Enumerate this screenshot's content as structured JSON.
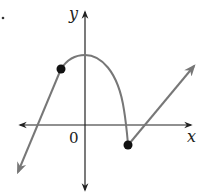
{
  "diagram": {
    "type": "piecewise-function-graph",
    "axes": {
      "x_label": "x",
      "y_label": "y",
      "origin_label": "0"
    },
    "pieces": [
      {
        "kind": "ray",
        "description": "line from closed point going down-left with arrow",
        "endpoint": "closed"
      },
      {
        "kind": "parabola",
        "description": "downward-opening arc from left closed point, peaking on y-axis, descending to right closed point below x-axis"
      },
      {
        "kind": "ray",
        "description": "line from right closed point going up-right with arrow",
        "endpoint": "closed"
      }
    ],
    "points": [
      {
        "name": "left-closed-point",
        "filled": true
      },
      {
        "name": "right-closed-point",
        "filled": true
      }
    ],
    "colors": {
      "axis": "#222222",
      "curve": "#777777",
      "point": "#111111"
    }
  }
}
